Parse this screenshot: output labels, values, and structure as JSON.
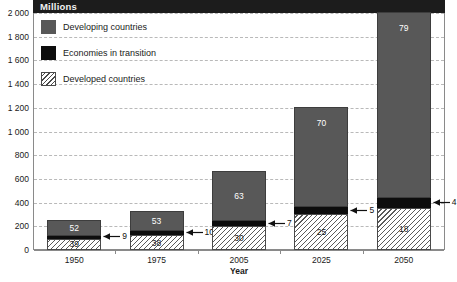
{
  "chart": {
    "title": "Millions",
    "xlabel": "Year",
    "ylabel": ""
  },
  "legend": {
    "items": [
      {
        "label": "Developing countries",
        "swatch": "solid-gray",
        "color": "#585858"
      },
      {
        "label": "Economies in transition",
        "swatch": "solid-black",
        "color": "#0d0d0d"
      },
      {
        "label": "Developed countries",
        "swatch": "hatched",
        "color": "#ffffff"
      }
    ]
  },
  "yaxis": {
    "ticks": [
      "0",
      "200",
      "400",
      "600",
      "800",
      "1 000",
      "1 200",
      "1 400",
      "1 600",
      "1 800",
      "2 000"
    ],
    "values": [
      0,
      200,
      400,
      600,
      800,
      1000,
      1200,
      1400,
      1600,
      1800,
      2000
    ],
    "min": 0,
    "max": 2000
  },
  "xaxis": {
    "ticks": [
      "1950",
      "1975",
      "2005",
      "2025",
      "2050"
    ]
  },
  "chart_data": {
    "type": "bar",
    "subtype": "stacked",
    "title": "Millions",
    "xlabel": "Year",
    "ylabel": "Millions",
    "ylim": [
      0,
      2000
    ],
    "grid": true,
    "legend_position": "top-left",
    "categories": [
      "1950",
      "1975",
      "2005",
      "2025",
      "2050"
    ],
    "series": [
      {
        "name": "Developed countries",
        "values": [
          97,
          125,
          201,
          302,
          358
        ],
        "labels": [
          "39",
          "38",
          "30",
          "25",
          "18"
        ],
        "label_unit": "percent",
        "style": "hatched"
      },
      {
        "name": "Economies in transition",
        "values": [
          23,
          33,
          47,
          60,
          80
        ],
        "labels": [
          "9",
          "10",
          "7",
          "5",
          "4"
        ],
        "label_unit": "percent",
        "style": "solid-black",
        "label_placement": "callout-arrow"
      },
      {
        "name": "Developing countries",
        "values": [
          130,
          175,
          422,
          848,
          1572
        ],
        "labels": [
          "52",
          "53",
          "63",
          "70",
          "79"
        ],
        "label_unit": "percent",
        "style": "solid-gray"
      }
    ],
    "totals": [
      250,
      333,
      670,
      1210,
      2010
    ]
  },
  "bars": [
    {
      "year": "1950",
      "developed": {
        "value": 97,
        "label": "39"
      },
      "transition": {
        "value": 23,
        "label": "9"
      },
      "developing": {
        "value": 130,
        "label": "52"
      }
    },
    {
      "year": "1975",
      "developed": {
        "value": 125,
        "label": "38"
      },
      "transition": {
        "value": 33,
        "label": "10"
      },
      "developing": {
        "value": 175,
        "label": "53"
      }
    },
    {
      "year": "2005",
      "developed": {
        "value": 201,
        "label": "30"
      },
      "transition": {
        "value": 47,
        "label": "7"
      },
      "developing": {
        "value": 422,
        "label": "63"
      }
    },
    {
      "year": "2025",
      "developed": {
        "value": 302,
        "label": "25"
      },
      "transition": {
        "value": 60,
        "label": "5"
      },
      "developing": {
        "value": 848,
        "label": "70"
      }
    },
    {
      "year": "2050",
      "developed": {
        "value": 358,
        "label": "18"
      },
      "transition": {
        "value": 80,
        "label": "4"
      },
      "developing": {
        "value": 1572,
        "label": "79"
      }
    }
  ]
}
